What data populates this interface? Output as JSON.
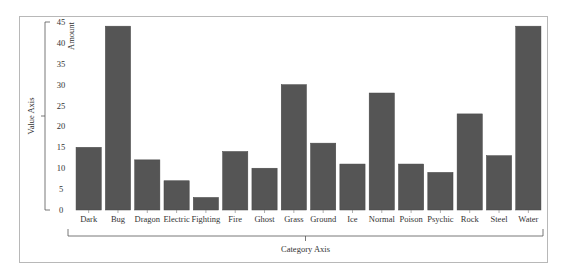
{
  "chart_data": {
    "type": "bar",
    "title": "",
    "xlabel": "Category Axis",
    "ylabel": "Value Axis",
    "series_label": "Amount",
    "categories": [
      "Dark",
      "Bug",
      "Dragon",
      "Electric",
      "Fighting",
      "Fire",
      "Ghost",
      "Grass",
      "Ground",
      "Ice",
      "Normal",
      "Poison",
      "Psychic",
      "Rock",
      "Steel",
      "Water"
    ],
    "values": [
      15,
      44,
      12,
      7,
      3,
      14,
      10,
      30,
      16,
      11,
      28,
      11,
      9,
      23,
      13,
      44
    ],
    "ylim": [
      0,
      45
    ],
    "yticks": [
      0,
      5,
      10,
      15,
      20,
      25,
      30,
      35,
      40,
      45
    ],
    "grid": false,
    "legend": "none",
    "bar_color": "#555555"
  }
}
